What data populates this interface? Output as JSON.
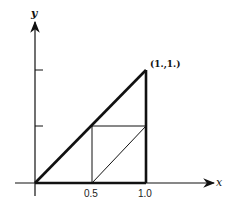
{
  "diagram": {
    "axes": {
      "x_label": "x",
      "y_label": "y",
      "x_ticks": [
        "0.5",
        "1.0"
      ]
    },
    "point_label": "(1.,1.)",
    "colors": {
      "stroke": "#111111",
      "background": "#ffffff"
    }
  }
}
